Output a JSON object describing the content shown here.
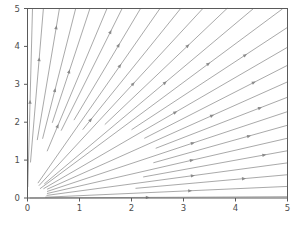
{
  "chart_data": {
    "type": "line",
    "plot_kind": "streamplot",
    "title": "",
    "xlabel": "",
    "ylabel": "",
    "xlim": [
      0,
      5
    ],
    "ylim": [
      0,
      5
    ],
    "xticks": [
      0,
      1,
      2,
      3,
      4,
      5
    ],
    "yticks": [
      0,
      1,
      2,
      3,
      4,
      5
    ],
    "xtick_labels": [
      "0",
      "1",
      "2",
      "3",
      "4",
      "5"
    ],
    "ytick_labels": [
      "0",
      "1",
      "2",
      "3",
      "4",
      "5"
    ],
    "grid": false,
    "legend": null,
    "line_color": "#9a9a9a",
    "arrow_color": "#8a8a8a",
    "frame_color": "#5a5a5a",
    "background": "#ffffff",
    "field_description": "radial outward vector field u=x, v=y on first quadrant",
    "streamlines": [
      {
        "angle_deg": 88.9,
        "r_start": 0.3,
        "r_end": 5.0,
        "arrow_r": 2.52
      },
      {
        "angle_deg": 86.5,
        "r_start": 0.95,
        "r_end": 5.01,
        "arrow_r": 3.65
      },
      {
        "angle_deg": 83.0,
        "r_start": 1.55,
        "r_end": 5.04,
        "arrow_r": 4.52
      },
      {
        "angle_deg": 79.5,
        "r_start": 1.6,
        "r_end": 5.09,
        "arrow_r": 2.88
      },
      {
        "angle_deg": 76.5,
        "r_start": 2.05,
        "r_end": 5.14,
        "arrow_r": 3.42
      },
      {
        "angle_deg": 73.0,
        "r_start": 1.3,
        "r_end": 5.23,
        "arrow_r": 1.97
      },
      {
        "angle_deg": 70.0,
        "r_start": 1.9,
        "r_end": 5.32,
        "arrow_r": 4.65
      },
      {
        "angle_deg": 66.5,
        "r_start": 2.25,
        "r_end": 5.45,
        "arrow_r": 4.38
      },
      {
        "angle_deg": 63.0,
        "r_start": 0.45,
        "r_end": 5.61,
        "arrow_r": 3.9
      },
      {
        "angle_deg": 59.5,
        "r_start": 2.1,
        "r_end": 5.81,
        "arrow_r": 2.38
      },
      {
        "angle_deg": 56.0,
        "r_start": 0.4,
        "r_end": 6.03,
        "arrow_r": 3.62
      },
      {
        "angle_deg": 52.5,
        "r_start": 2.45,
        "r_end": 6.3,
        "arrow_r": 5.05
      },
      {
        "angle_deg": 49.0,
        "r_start": 0.5,
        "r_end": 6.61,
        "arrow_r": 4.02
      },
      {
        "angle_deg": 45.5,
        "r_start": 0.35,
        "r_end": 6.99,
        "arrow_r": 4.95
      },
      {
        "angle_deg": 42.0,
        "r_start": 2.7,
        "r_end": 6.72,
        "arrow_r": 5.62
      },
      {
        "angle_deg": 38.5,
        "r_start": 0.4,
        "r_end": 6.39,
        "arrow_r": 3.62
      },
      {
        "angle_deg": 35.0,
        "r_start": 2.75,
        "r_end": 6.1,
        "arrow_r": 5.3
      },
      {
        "angle_deg": 31.5,
        "r_start": 0.45,
        "r_end": 5.86,
        "arrow_r": 4.15
      },
      {
        "angle_deg": 28.0,
        "r_start": 2.8,
        "r_end": 5.66,
        "arrow_r": 5.05
      },
      {
        "angle_deg": 24.5,
        "r_start": 0.42,
        "r_end": 5.49,
        "arrow_r": 3.48
      },
      {
        "angle_deg": 21.0,
        "r_start": 2.6,
        "r_end": 5.36,
        "arrow_r": 4.55
      },
      {
        "angle_deg": 17.5,
        "r_start": 0.4,
        "r_end": 5.24,
        "arrow_r": 3.3
      },
      {
        "angle_deg": 14.0,
        "r_start": 2.3,
        "r_end": 5.15,
        "arrow_r": 4.68
      },
      {
        "angle_deg": 10.5,
        "r_start": 0.38,
        "r_end": 5.09,
        "arrow_r": 3.22
      },
      {
        "angle_deg": 7.0,
        "r_start": 2.1,
        "r_end": 5.04,
        "arrow_r": 4.18
      },
      {
        "angle_deg": 3.5,
        "r_start": 0.35,
        "r_end": 5.01,
        "arrow_r": 3.12
      },
      {
        "angle_deg": 0.4,
        "r_start": 0.05,
        "r_end": 5.0,
        "arrow_r": 2.3
      }
    ]
  },
  "axes": {
    "frame_name": "plot-frame",
    "x_axis_name": "x-axis",
    "y_axis_name": "y-axis"
  }
}
